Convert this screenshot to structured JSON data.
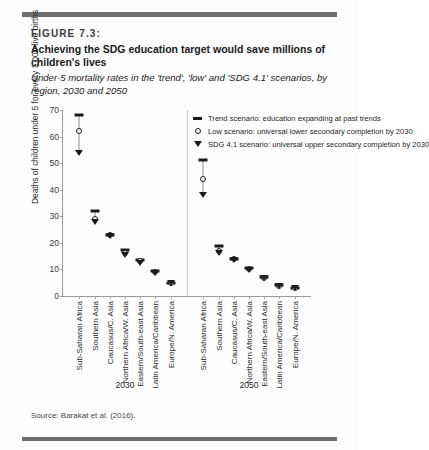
{
  "figure": {
    "label": "FIGURE 7.3:",
    "title": "Achieving the SDG education target would save millions of children's lives",
    "subtitle": "Under-5 mortality rates in the 'trend', 'low' and 'SDG 4.1' scenarios, by region, 2030 and 2050",
    "source": "Source: Barakat et al. (2016)."
  },
  "chart_data": {
    "type": "scatter",
    "title": "Achieving the SDG education target would save millions of children's lives",
    "subtitle": "Under-5 mortality rates in the 'trend', 'low' and 'SDG 4.1' scenarios, by region, 2030 and 2050",
    "xlabel": "",
    "ylabel": "Deaths of children under 5 for every 1,000 live births",
    "ylim": [
      0,
      70
    ],
    "yticks": [
      0,
      10,
      20,
      30,
      40,
      50,
      60,
      70
    ],
    "grid": false,
    "legend_position": "top-right",
    "groups": [
      "2030",
      "2050"
    ],
    "categories": [
      "Sub-Saharan Africa",
      "Southern Asia",
      "Caucasus/C. Asia",
      "Northern Africa/W. Asia",
      "Eastern/South-east Asia",
      "Latin America/Caribbean",
      "Europe/N. America"
    ],
    "series": [
      {
        "name": "Trend scenario: education expanding at past trends",
        "marker": "dash",
        "values_2030": [
          68,
          32,
          23,
          17.5,
          13.5,
          9.5,
          5
        ],
        "values_2050": [
          51,
          19,
          14,
          10.5,
          7,
          4,
          3
        ]
      },
      {
        "name": "Low scenario: universal lower secondary completion by 2030",
        "marker": "open-circle",
        "values_2030": [
          62,
          29,
          22.8,
          16.2,
          13,
          9.2,
          5
        ],
        "values_2050": [
          44,
          17,
          13.8,
          10,
          6.9,
          3.9,
          3
        ]
      },
      {
        "name": "SDG 4.1 scenario: universal upper secondary completion by 2030",
        "marker": "filled-triangle-down",
        "values_2030": [
          54,
          28,
          22.5,
          15.5,
          12.5,
          8.8,
          5
        ],
        "values_2050": [
          38,
          16,
          13.6,
          9.8,
          6.8,
          3.8,
          2.9
        ]
      }
    ]
  },
  "legend": {
    "items": [
      {
        "marker": "dash",
        "label": "Trend scenario: education expanding at past trends"
      },
      {
        "marker": "open-circle",
        "label": "Low scenario: universal lower secondary completion by 2030"
      },
      {
        "marker": "filled-triangle-down",
        "label": "SDG 4.1 scenario: universal upper secondary completion by 2030"
      }
    ]
  }
}
